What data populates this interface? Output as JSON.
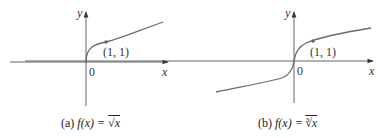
{
  "figures": [
    {
      "id": "a",
      "caption_prefix": "(a)",
      "caption_func": "f(x) = ",
      "caption_radical": "√x",
      "axis_x_label": "x",
      "axis_y_label": "y",
      "origin_label": "0",
      "point_label": "(1, 1)"
    },
    {
      "id": "b",
      "caption_prefix": "(b)",
      "caption_func": "f(x) = ",
      "caption_index": "3",
      "caption_radical": "√x",
      "axis_x_label": "x",
      "axis_y_label": "y",
      "origin_label": "0",
      "point_label": "(1, 1)"
    }
  ],
  "colors": {
    "curve": "#6b6b6b",
    "axis": "#444444",
    "point": "#666666"
  }
}
